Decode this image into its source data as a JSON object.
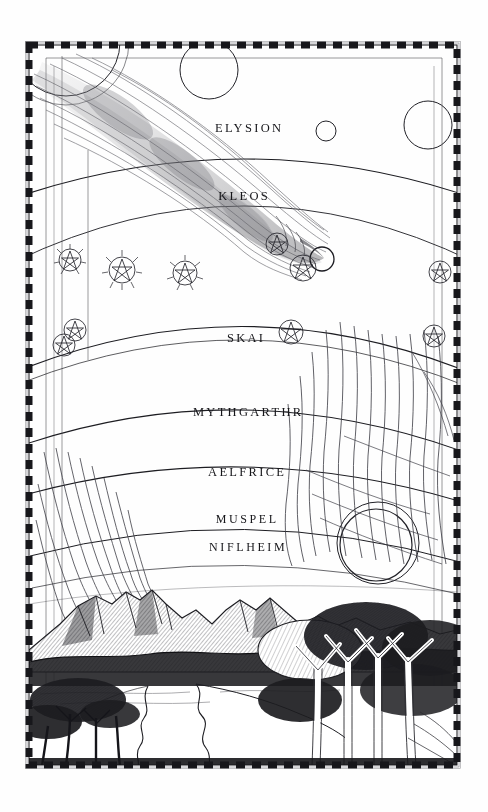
{
  "illustration": {
    "title": "Cosmological Diagram of the Seven Worlds",
    "medium": "pen-and-ink drawing",
    "background_color": "#fefefe",
    "ink_color": "#1a1a1e",
    "frame": {
      "style": "dashed-checker border",
      "x": 28,
      "y": 44,
      "width": 430,
      "height": 722
    }
  },
  "realms": [
    {
      "name": "ELYSION",
      "cx": 248,
      "cy": 128,
      "order": 1
    },
    {
      "name": "KLEOS",
      "cx": 243,
      "cy": 196,
      "order": 2
    },
    {
      "name": "SKAI",
      "cx": 245,
      "cy": 338,
      "order": 3
    },
    {
      "name": "MYTHGARTHR",
      "cx": 247,
      "cy": 412,
      "order": 4
    },
    {
      "name": "AELFRICE",
      "cx": 246,
      "cy": 472,
      "order": 5
    },
    {
      "name": "MUSPEL",
      "cx": 246,
      "cy": 519,
      "order": 6
    },
    {
      "name": "NIFLHEIM",
      "cx": 247,
      "cy": 547,
      "order": 7
    }
  ],
  "celestial_bodies": [
    {
      "name": "upper-left-sphere",
      "cx": 66,
      "cy": 44,
      "r": 52,
      "rings": 1
    },
    {
      "name": "upper-moon",
      "cx": 209,
      "cy": 70,
      "r": 29,
      "rings": 1
    },
    {
      "name": "small-moon",
      "cx": 326,
      "cy": 131,
      "r": 10,
      "rings": 1
    },
    {
      "name": "right-moon",
      "cx": 428,
      "cy": 125,
      "r": 24,
      "rings": 1
    },
    {
      "name": "lower-great-sphere",
      "cx": 378,
      "cy": 543,
      "r": 41,
      "rings": 2
    }
  ],
  "stars": [
    {
      "cx": 70,
      "cy": 260,
      "r": 11,
      "spiked": true
    },
    {
      "cx": 122,
      "cy": 270,
      "r": 13,
      "spiked": true
    },
    {
      "cx": 185,
      "cy": 273,
      "r": 12,
      "spiked": true
    },
    {
      "cx": 277,
      "cy": 244,
      "r": 11,
      "spiked": false
    },
    {
      "cx": 303,
      "cy": 268,
      "r": 13,
      "spiked": false
    },
    {
      "cx": 440,
      "cy": 272,
      "r": 11,
      "spiked": false
    },
    {
      "cx": 75,
      "cy": 330,
      "r": 11,
      "spiked": false
    },
    {
      "cx": 65,
      "cy": 343,
      "r": 11,
      "spiked": false
    },
    {
      "cx": 291,
      "cy": 332,
      "r": 12,
      "spiked": false
    },
    {
      "cx": 434,
      "cy": 336,
      "r": 11,
      "spiked": false
    }
  ],
  "comet": {
    "name": "great-comet",
    "head_cx": 322,
    "head_cy": 258,
    "head_r": 12,
    "tail_from": [
      48,
      72
    ],
    "tail_to": [
      322,
      258
    ],
    "description": "comet with long streaming tail crossing upper spheres"
  },
  "landscape": {
    "horizon_y": 612,
    "features": [
      "mountain-range",
      "winding-river",
      "foreground-trees",
      "left-grove"
    ]
  },
  "arcs": {
    "count": 7,
    "description": "concentric arcs separating the seven worlds"
  }
}
